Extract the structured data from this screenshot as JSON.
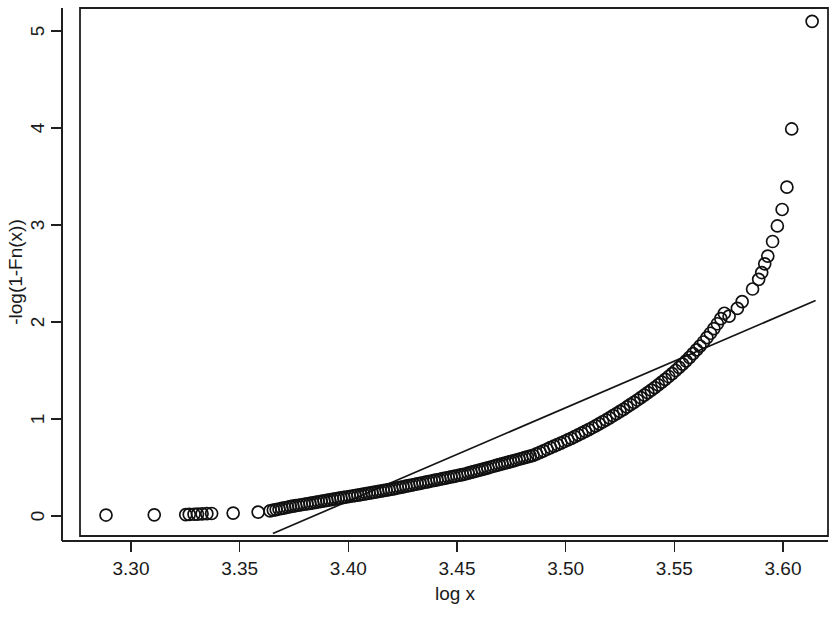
{
  "chart_data": {
    "type": "scatter",
    "title": "",
    "xlabel": "log x",
    "ylabel": "-log(1-Fn(x))",
    "xlim": [
      3.277,
      3.622
    ],
    "ylim": [
      -0.19,
      5.45
    ],
    "xticks": [
      3.3,
      3.35,
      3.4,
      3.45,
      3.5,
      3.55,
      3.6
    ],
    "xtick_labels": [
      "3.30",
      "3.35",
      "3.40",
      "3.45",
      "3.50",
      "3.55",
      "3.60"
    ],
    "yticks": [
      0,
      1,
      2,
      3,
      4,
      5
    ],
    "ytick_labels": [
      "0",
      "1",
      "2",
      "3",
      "4",
      "5"
    ],
    "grid": false,
    "legend": null,
    "marker": "open-circle",
    "marker_size": 7.6,
    "point_color": "#111111",
    "line_color": "#151515",
    "background": "#ffffff",
    "frame": "box",
    "series": [
      {
        "name": "empirical exceedance",
        "type": "scatter",
        "x": [
          3.2885,
          3.3107,
          3.3252,
          3.3268,
          3.329,
          3.3306,
          3.3327,
          3.3349,
          3.3371,
          3.347,
          3.3585,
          3.364,
          3.3655,
          3.3668,
          3.3681,
          3.3694,
          3.3707,
          3.372,
          3.3733,
          3.3745,
          3.3758,
          3.3771,
          3.3784,
          3.3797,
          3.381,
          3.3823,
          3.3836,
          3.3849,
          3.3862,
          3.3875,
          3.3888,
          3.3901,
          3.3914,
          3.3927,
          3.394,
          3.3953,
          3.3966,
          3.3979,
          3.3992,
          3.4005,
          3.4018,
          3.4031,
          3.4044,
          3.4057,
          3.407,
          3.4083,
          3.4096,
          3.4109,
          3.4122,
          3.4135,
          3.4148,
          3.4161,
          3.4174,
          3.4187,
          3.42,
          3.4213,
          3.4226,
          3.4239,
          3.4252,
          3.4265,
          3.4278,
          3.4291,
          3.4304,
          3.4317,
          3.433,
          3.4343,
          3.4356,
          3.4369,
          3.4382,
          3.4395,
          3.4408,
          3.4421,
          3.4434,
          3.4447,
          3.446,
          3.4473,
          3.4486,
          3.4499,
          3.4512,
          3.4525,
          3.4538,
          3.4551,
          3.4564,
          3.4577,
          3.459,
          3.4603,
          3.4616,
          3.4629,
          3.4642,
          3.4655,
          3.4668,
          3.4681,
          3.4694,
          3.4707,
          3.472,
          3.4733,
          3.4746,
          3.4759,
          3.4772,
          3.4785,
          3.4798,
          3.4811,
          3.4824,
          3.4837,
          3.485,
          3.4866,
          3.4882,
          3.4898,
          3.4914,
          3.493,
          3.4946,
          3.4962,
          3.4978,
          3.4994,
          3.501,
          3.5026,
          3.5042,
          3.5058,
          3.5074,
          3.509,
          3.5106,
          3.5122,
          3.5138,
          3.5154,
          3.517,
          3.5186,
          3.5202,
          3.5218,
          3.5234,
          3.525,
          3.5266,
          3.5282,
          3.5298,
          3.5314,
          3.533,
          3.5346,
          3.5362,
          3.5378,
          3.5394,
          3.541,
          3.5426,
          3.5442,
          3.5458,
          3.5474,
          3.549,
          3.5506,
          3.5522,
          3.5538,
          3.5554,
          3.557,
          3.5586,
          3.5602,
          3.5618,
          3.5634,
          3.565,
          3.5666,
          3.5682,
          3.5698,
          3.5714,
          3.573,
          3.5752,
          3.579,
          3.5812,
          3.586,
          3.5888,
          3.5902,
          3.5916,
          3.593,
          3.5952,
          3.5974,
          3.5996,
          3.6018,
          3.604,
          3.6134
        ],
        "y": [
          0.01,
          0.012,
          0.014,
          0.016,
          0.018,
          0.02,
          0.022,
          0.024,
          0.026,
          0.03,
          0.04,
          0.052,
          0.06,
          0.066,
          0.072,
          0.078,
          0.084,
          0.09,
          0.096,
          0.101,
          0.106,
          0.111,
          0.116,
          0.121,
          0.126,
          0.131,
          0.136,
          0.141,
          0.146,
          0.151,
          0.156,
          0.161,
          0.166,
          0.171,
          0.176,
          0.181,
          0.186,
          0.191,
          0.196,
          0.201,
          0.206,
          0.211,
          0.216,
          0.221,
          0.226,
          0.231,
          0.236,
          0.241,
          0.246,
          0.251,
          0.256,
          0.261,
          0.266,
          0.271,
          0.277,
          0.283,
          0.289,
          0.295,
          0.301,
          0.307,
          0.313,
          0.319,
          0.325,
          0.331,
          0.337,
          0.343,
          0.349,
          0.355,
          0.361,
          0.367,
          0.373,
          0.379,
          0.385,
          0.391,
          0.397,
          0.403,
          0.409,
          0.415,
          0.421,
          0.427,
          0.433,
          0.441,
          0.449,
          0.457,
          0.465,
          0.473,
          0.481,
          0.489,
          0.497,
          0.505,
          0.513,
          0.521,
          0.529,
          0.537,
          0.545,
          0.553,
          0.561,
          0.569,
          0.577,
          0.585,
          0.593,
          0.601,
          0.609,
          0.617,
          0.625,
          0.64,
          0.656,
          0.672,
          0.688,
          0.704,
          0.72,
          0.736,
          0.752,
          0.768,
          0.784,
          0.8,
          0.818,
          0.836,
          0.854,
          0.872,
          0.89,
          0.91,
          0.93,
          0.95,
          0.97,
          0.99,
          1.012,
          1.034,
          1.056,
          1.078,
          1.1,
          1.124,
          1.148,
          1.172,
          1.196,
          1.22,
          1.246,
          1.272,
          1.298,
          1.324,
          1.352,
          1.38,
          1.408,
          1.438,
          1.468,
          1.5,
          1.532,
          1.566,
          1.6,
          1.636,
          1.674,
          1.712,
          1.752,
          1.794,
          1.838,
          1.884,
          1.932,
          1.982,
          2.034,
          2.09,
          2.06,
          2.14,
          2.21,
          2.34,
          2.44,
          2.51,
          2.6,
          2.68,
          2.83,
          2.99,
          3.16,
          3.39,
          3.99,
          5.1
        ]
      },
      {
        "name": "fitted exponential line",
        "type": "line",
        "x": [
          3.3653,
          3.615
        ],
        "y": [
          -0.18,
          2.222
        ]
      }
    ]
  },
  "axes": {
    "x_title": "log x",
    "y_title": "-log(1-Fn(x))"
  }
}
